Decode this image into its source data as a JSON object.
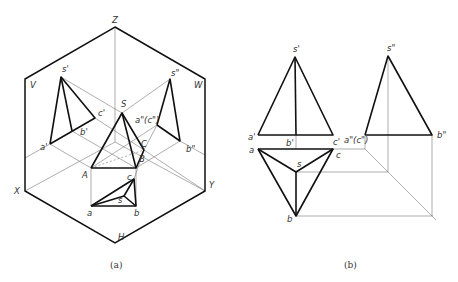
{
  "figure_a": {
    "caption": "(a)",
    "planes": {
      "V": "V",
      "W": "W",
      "H": "H"
    },
    "axes": {
      "X": "X",
      "Y": "Y",
      "Z": "Z"
    },
    "labels": {
      "s_v": "s'",
      "a_v": "a'",
      "b_v": "b'",
      "c_v": "c'",
      "s_w": "s\"",
      "ac_w": "a\"(c\")",
      "b_w": "b\"",
      "S": "S",
      "A": "A",
      "B": "B",
      "C": "C",
      "a_h": "a",
      "b_h": "b",
      "c_h": "c",
      "s_h": "s"
    }
  },
  "figure_b": {
    "caption": "(b)",
    "labels": {
      "s_v": "s'",
      "a_v": "a'",
      "b_v": "b'",
      "c_v": "c'",
      "s_w": "s\"",
      "ac_w": "a\"(c\")",
      "b_w": "b\"",
      "a_h": "a",
      "b_h": "b",
      "c_h": "c",
      "s_h": "s"
    }
  }
}
